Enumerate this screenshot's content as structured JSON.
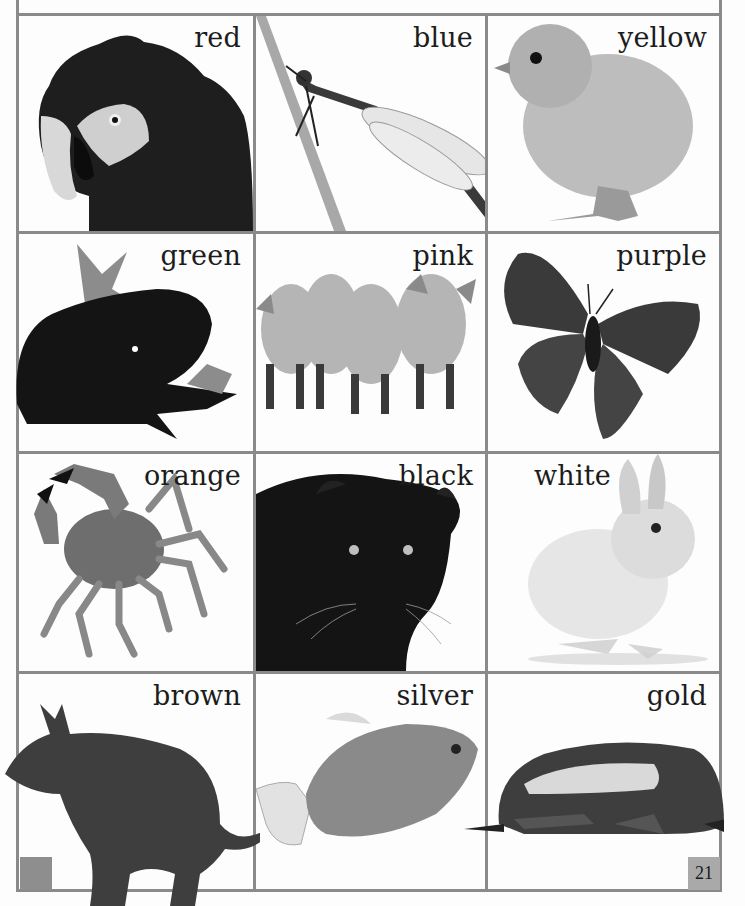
{
  "page": {
    "page_number": "21",
    "grid": {
      "columns": 3,
      "rows": 4
    },
    "colors": {
      "grid_line": "#8a8a8a",
      "page_number_box": "#a9a9a9",
      "corner_block": "#8e8e8e",
      "text": "#1c1c1c"
    }
  },
  "cells": [
    {
      "word": "red",
      "animal": "parrot"
    },
    {
      "word": "blue",
      "animal": "damselfly"
    },
    {
      "word": "yellow",
      "animal": "chick"
    },
    {
      "word": "green",
      "animal": "frog"
    },
    {
      "word": "pink",
      "animal": "piglets"
    },
    {
      "word": "purple",
      "animal": "butterfly"
    },
    {
      "word": "orange",
      "animal": "crab"
    },
    {
      "word": "black",
      "animal": "panther"
    },
    {
      "word": "white",
      "animal": "rabbit"
    },
    {
      "word": "brown",
      "animal": "kangaroo"
    },
    {
      "word": "silver",
      "animal": "fish"
    },
    {
      "word": "gold",
      "animal": "beetle"
    }
  ]
}
